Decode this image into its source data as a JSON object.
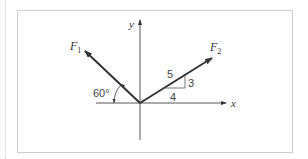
{
  "diagram": {
    "forces": [
      {
        "name": "F",
        "subscript": "1"
      },
      {
        "name": "F",
        "subscript": "2"
      }
    ],
    "axes": {
      "x": "x",
      "y": "y"
    },
    "angle_label": "60°",
    "slope_triangle": {
      "hyp": "5",
      "rise": "3",
      "run": "4"
    },
    "colors": {
      "line": "#333333",
      "frame": "#cfcfcf"
    }
  }
}
